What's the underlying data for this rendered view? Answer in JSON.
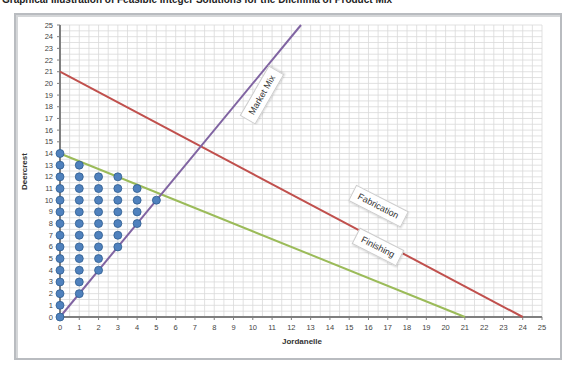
{
  "page": {
    "title": "Graphical Illustration of Feasible Integer Solutions for the Dilemma of Product Mix"
  },
  "chart_data": {
    "type": "line",
    "title": "",
    "xlabel": "Jordanelle",
    "ylabel": "Deercrest",
    "xlim": [
      0,
      25
    ],
    "ylim": [
      0,
      25
    ],
    "x_ticks": [
      0,
      1,
      2,
      3,
      4,
      5,
      6,
      7,
      8,
      9,
      10,
      11,
      12,
      13,
      14,
      15,
      16,
      17,
      18,
      19,
      20,
      21,
      22,
      23,
      24,
      25
    ],
    "y_ticks": [
      0,
      1,
      2,
      3,
      4,
      5,
      6,
      7,
      8,
      9,
      10,
      11,
      12,
      13,
      14,
      15,
      16,
      17,
      18,
      19,
      20,
      21,
      22,
      23,
      24,
      25
    ],
    "grid": true,
    "grid_step": 0.5,
    "series": [
      {
        "name": "Fabrication",
        "color": "#c0504d",
        "points": [
          [
            0,
            21
          ],
          [
            24,
            0
          ]
        ]
      },
      {
        "name": "Finishing",
        "color": "#9bbb59",
        "points": [
          [
            0,
            14
          ],
          [
            21,
            0
          ]
        ]
      },
      {
        "name": "Market Mix",
        "color": "#8064a2",
        "points": [
          [
            0,
            0
          ],
          [
            12.5,
            25
          ]
        ]
      }
    ],
    "feasible_points": {
      "color": "#4f81bd",
      "points": [
        [
          0,
          0
        ],
        [
          0,
          1
        ],
        [
          0,
          2
        ],
        [
          0,
          3
        ],
        [
          0,
          4
        ],
        [
          0,
          5
        ],
        [
          0,
          6
        ],
        [
          0,
          7
        ],
        [
          0,
          8
        ],
        [
          0,
          9
        ],
        [
          0,
          10
        ],
        [
          0,
          11
        ],
        [
          0,
          12
        ],
        [
          0,
          13
        ],
        [
          0,
          14
        ],
        [
          1,
          2
        ],
        [
          1,
          3
        ],
        [
          1,
          4
        ],
        [
          1,
          5
        ],
        [
          1,
          6
        ],
        [
          1,
          7
        ],
        [
          1,
          8
        ],
        [
          1,
          9
        ],
        [
          1,
          10
        ],
        [
          1,
          11
        ],
        [
          1,
          12
        ],
        [
          1,
          13
        ],
        [
          2,
          4
        ],
        [
          2,
          5
        ],
        [
          2,
          6
        ],
        [
          2,
          7
        ],
        [
          2,
          8
        ],
        [
          2,
          9
        ],
        [
          2,
          10
        ],
        [
          2,
          11
        ],
        [
          2,
          12
        ],
        [
          3,
          6
        ],
        [
          3,
          7
        ],
        [
          3,
          8
        ],
        [
          3,
          9
        ],
        [
          3,
          10
        ],
        [
          3,
          11
        ],
        [
          3,
          12
        ],
        [
          4,
          8
        ],
        [
          4,
          9
        ],
        [
          4,
          10
        ],
        [
          4,
          11
        ],
        [
          5,
          10
        ]
      ]
    },
    "annotations": [
      {
        "text": "Market Mix",
        "x": 10.5,
        "y": 19,
        "rotation": -60
      },
      {
        "text": "Fabrication",
        "x": 16.5,
        "y": 9.5,
        "rotation": 27
      },
      {
        "text": "Finishing",
        "x": 16.5,
        "y": 6,
        "rotation": 27
      }
    ]
  }
}
